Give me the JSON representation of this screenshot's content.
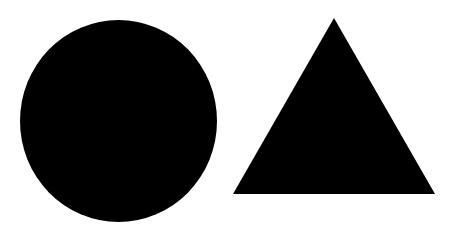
{
  "canvas": {
    "width": 455,
    "height": 231,
    "background": "#ffffff"
  },
  "shapes": [
    {
      "type": "circle",
      "fill": "#000000",
      "cx": 118.5,
      "cy": 121,
      "rx": 98.5,
      "ry": 101
    },
    {
      "type": "triangle",
      "fill": "#000000",
      "points": "334,18 233,194 435,194"
    }
  ]
}
